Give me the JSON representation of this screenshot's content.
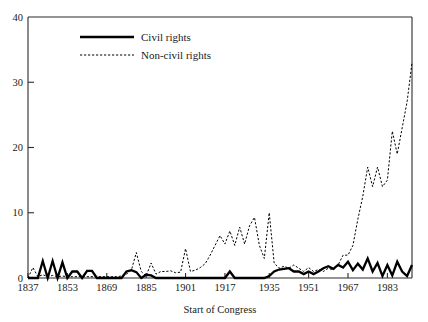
{
  "chart_data": {
    "type": "line",
    "title": "",
    "xlabel": "Start of Congress",
    "ylabel": "",
    "xlim": [
      1837,
      1993
    ],
    "ylim": [
      0,
      40
    ],
    "xticks": [
      1837,
      1853,
      1869,
      1885,
      1901,
      1917,
      1935,
      1951,
      1967,
      1983
    ],
    "xtick_labels": [
      "1837",
      "1853",
      "1869",
      "1885",
      "1901",
      "1917",
      "1935",
      "1951",
      "1967",
      "1983"
    ],
    "yticks": [
      0,
      10,
      20,
      30,
      40
    ],
    "ytick_labels": [
      "0",
      "10",
      "20",
      "30",
      "40"
    ],
    "grid": false,
    "legend_position": "top-center",
    "x": [
      1837,
      1839,
      1841,
      1843,
      1845,
      1847,
      1849,
      1851,
      1853,
      1855,
      1857,
      1859,
      1861,
      1863,
      1865,
      1867,
      1869,
      1871,
      1873,
      1875,
      1877,
      1879,
      1881,
      1883,
      1885,
      1887,
      1889,
      1891,
      1893,
      1895,
      1897,
      1899,
      1901,
      1903,
      1905,
      1907,
      1909,
      1911,
      1913,
      1915,
      1917,
      1919,
      1921,
      1923,
      1925,
      1927,
      1929,
      1931,
      1933,
      1935,
      1937,
      1939,
      1941,
      1943,
      1945,
      1947,
      1949,
      1951,
      1953,
      1955,
      1957,
      1959,
      1961,
      1963,
      1965,
      1967,
      1969,
      1971,
      1973,
      1975,
      1977,
      1979,
      1981,
      1983,
      1985,
      1987,
      1989,
      1991,
      1993
    ],
    "series": [
      {
        "name": "Civil rights",
        "style": "solid",
        "values": [
          0,
          0,
          0,
          2.6,
          0,
          2.6,
          0,
          2.4,
          0,
          1.0,
          1.0,
          0,
          1.1,
          1.1,
          0,
          0,
          0,
          0,
          0,
          0,
          1.0,
          1.2,
          0.9,
          0,
          0.5,
          0.4,
          0,
          0,
          0,
          0,
          0,
          0,
          0,
          0,
          0,
          0,
          0,
          0,
          0,
          0,
          0,
          1.0,
          0,
          0,
          0,
          0,
          0,
          0,
          0,
          0.3,
          1.0,
          1.3,
          1.4,
          1.5,
          1.0,
          1.0,
          0.6,
          1.0,
          0.6,
          1.0,
          1.5,
          1.8,
          1.4,
          2.0,
          1.6,
          2.5,
          1.2,
          2.2,
          1.3,
          3.0,
          1.0,
          2.3,
          0.3,
          2.0,
          0.4,
          2.5,
          1.0,
          0.3,
          2.0
        ]
      },
      {
        "name": "Non-civil rights",
        "style": "dashed",
        "values": [
          0,
          1.6,
          0.2,
          0.5,
          0.2,
          0.4,
          0.2,
          0.3,
          0.2,
          0.2,
          0.2,
          0.2,
          0.2,
          0.2,
          0.2,
          0.2,
          0.2,
          0.2,
          0.2,
          0.3,
          0.6,
          1.2,
          3.9,
          1.0,
          0.3,
          2.3,
          0.6,
          1.0,
          1.0,
          1.1,
          0.8,
          0.9,
          4.5,
          1.0,
          1.2,
          1.6,
          2.2,
          3.5,
          5.0,
          6.5,
          5.2,
          7.2,
          5.0,
          7.8,
          5.2,
          8.0,
          9.3,
          5.0,
          3.0,
          10.0,
          2.3,
          1.5,
          1.8,
          1.5,
          2.0,
          1.5,
          1.0,
          1.6,
          1.0,
          1.3,
          1.0,
          1.5,
          1.2,
          2.0,
          3.5,
          3.5,
          5.0,
          9.0,
          12.5,
          17.0,
          14.0,
          17.0,
          14.0,
          15.0,
          22.5,
          19.0,
          23.0,
          27.0,
          33.0
        ]
      }
    ]
  },
  "legend": {
    "items": [
      {
        "label": "Civil rights",
        "style": "solid"
      },
      {
        "label": "Non-civil rights",
        "style": "dashed"
      }
    ]
  }
}
